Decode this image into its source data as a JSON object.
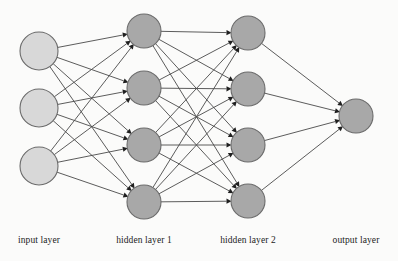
{
  "figure": {
    "background_color": "#fbfbfa"
  },
  "labels": {
    "input": "input layer",
    "hidden1": "hidden layer 1",
    "hidden2": "hidden layer 2",
    "output": "output layer"
  },
  "colors": {
    "input_node_fill": "#d8d8d8",
    "hidden_node_fill": "#a8a8a8",
    "output_node_fill": "#a8a8a8",
    "node_stroke": "#6b6b6b",
    "edge_stroke": "#4a4a4a",
    "arrowhead_fill": "#1f1f1f",
    "label_text": "#1c1c1c"
  },
  "chart_data": {
    "type": "diagram",
    "layers": [
      {
        "id": "input",
        "label": "input layer",
        "node_count": 3,
        "x": 39,
        "radius": 19,
        "fill": "#d8d8d8",
        "label_x": 39,
        "nodes": [
          {
            "id": "i1",
            "cx": 39,
            "cy": 51
          },
          {
            "id": "i2",
            "cx": 39,
            "cy": 108
          },
          {
            "id": "i3",
            "cx": 39,
            "cy": 166
          }
        ]
      },
      {
        "id": "hidden1",
        "label": "hidden layer 1",
        "node_count": 4,
        "x": 144,
        "radius": 17,
        "fill": "#a8a8a8",
        "label_x": 144,
        "nodes": [
          {
            "id": "h1_1",
            "cx": 144,
            "cy": 31
          },
          {
            "id": "h1_2",
            "cx": 144,
            "cy": 88
          },
          {
            "id": "h1_3",
            "cx": 144,
            "cy": 145
          },
          {
            "id": "h1_4",
            "cx": 144,
            "cy": 202
          }
        ]
      },
      {
        "id": "hidden2",
        "label": "hidden layer 2",
        "node_count": 4,
        "x": 248,
        "radius": 17,
        "fill": "#a8a8a8",
        "label_x": 248,
        "nodes": [
          {
            "id": "h2_1",
            "cx": 248,
            "cy": 33
          },
          {
            "id": "h2_2",
            "cx": 248,
            "cy": 89
          },
          {
            "id": "h2_3",
            "cx": 248,
            "cy": 145
          },
          {
            "id": "h2_4",
            "cx": 248,
            "cy": 201
          }
        ]
      },
      {
        "id": "output",
        "label": "output layer",
        "node_count": 1,
        "x": 356,
        "radius": 17,
        "fill": "#a8a8a8",
        "label_x": 356,
        "nodes": [
          {
            "id": "o1",
            "cx": 356,
            "cy": 116
          }
        ]
      }
    ],
    "connections": [
      {
        "from": "input",
        "to": "hidden1",
        "fully_connected": true,
        "edge_count": 12
      },
      {
        "from": "hidden1",
        "to": "hidden2",
        "fully_connected": true,
        "edge_count": 16
      },
      {
        "from": "hidden2",
        "to": "output",
        "fully_connected": true,
        "edge_count": 4
      }
    ],
    "total_edges": 32,
    "total_nodes": 12,
    "edge_direction": "left-to-right, arrowheads at target node",
    "label_y": 243
  }
}
